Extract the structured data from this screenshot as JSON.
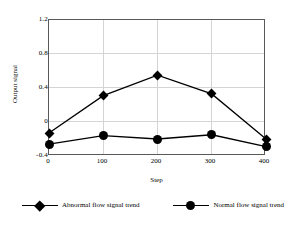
{
  "chart_data": {
    "type": "line",
    "title": "",
    "xlabel": "Step",
    "ylabel": "Output signal",
    "x": [
      0,
      100,
      200,
      300,
      400
    ],
    "xticklabels": [
      "0",
      "100",
      "200",
      "300",
      "400"
    ],
    "yticklabels": [
      "1.2",
      "0.8",
      "0.4",
      "0",
      "-0.4"
    ],
    "yticks": [
      1.2,
      0.8,
      0.4,
      0,
      -0.4
    ],
    "xlim": [
      0,
      400
    ],
    "ylim": [
      -0.4,
      1.2
    ],
    "grid": true,
    "legend_position": "below",
    "series": [
      {
        "name": "Abnormal flow signal trend",
        "marker": "diamond",
        "color": "#000000",
        "values": [
          -0.13,
          0.31,
          0.55,
          0.33,
          -0.2
        ]
      },
      {
        "name": "Normal flow signal trend",
        "marker": "circle",
        "color": "#000000",
        "values": [
          -0.26,
          -0.16,
          -0.2,
          -0.15,
          -0.29
        ]
      }
    ]
  },
  "legend": {
    "entries": [
      {
        "label": "Abnormal flow signal trend",
        "marker": "diamond-marker"
      },
      {
        "label": "Normal flow signal trend",
        "marker": "circle-marker"
      }
    ]
  },
  "axes": {
    "x_title": "Step",
    "y_title": "Output signal"
  }
}
